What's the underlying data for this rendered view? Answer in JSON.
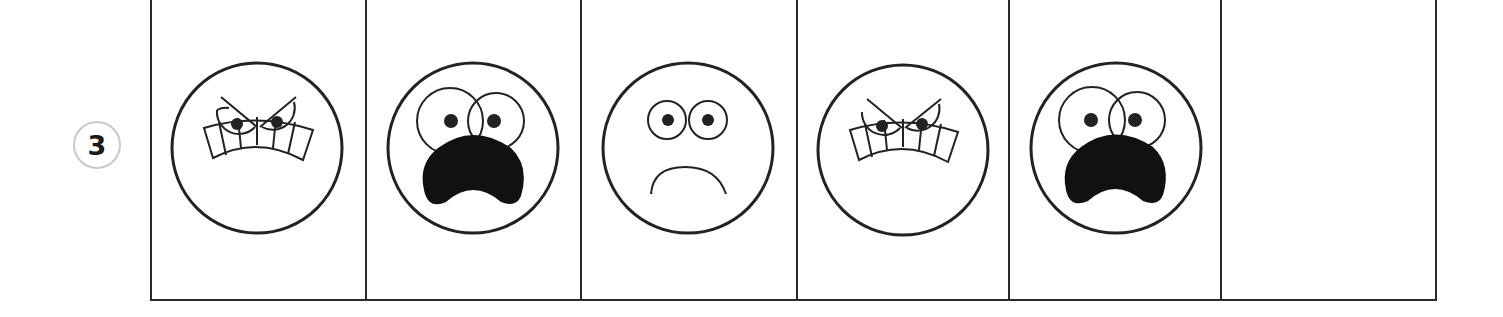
{
  "exercise": {
    "number": "3",
    "stroke_color": "#222222",
    "badge_border_color": "#c8c8c8"
  },
  "cells": [
    {
      "index": 1,
      "face": "angry",
      "icon": "angry-face-icon"
    },
    {
      "index": 2,
      "face": "scared",
      "icon": "scared-face-icon"
    },
    {
      "index": 3,
      "face": "sad",
      "icon": "sad-face-icon"
    },
    {
      "index": 4,
      "face": "angry",
      "icon": "angry-face-icon"
    },
    {
      "index": 5,
      "face": "scared",
      "icon": "scared-face-icon"
    },
    {
      "index": 6,
      "face": "",
      "icon": "empty-answer-cell"
    }
  ]
}
